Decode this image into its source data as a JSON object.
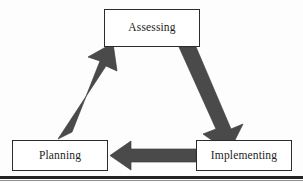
{
  "figure": {
    "type": "cyclical-process-diagram",
    "node_count": 3,
    "arrow_count": 3,
    "colors": {
      "background": "#fdfdfd",
      "box_fill": "#ffffff",
      "box_border": "#2b2b2b",
      "arrow_fill": "#4a4a4a",
      "arrow_edge": "#3a3a3a",
      "text": "#1c1c1c",
      "bottom_rule": "#232323"
    },
    "nodes": [
      {
        "id": "assessing",
        "label": "Assessing"
      },
      {
        "id": "implementing",
        "label": "Implementing"
      },
      {
        "id": "planning",
        "label": "Planning"
      }
    ],
    "arrows": [
      {
        "id": "assessing-to-implementing",
        "from": "Assessing",
        "to": "Implementing",
        "direction": "down-right"
      },
      {
        "id": "implementing-to-planning",
        "from": "Implementing",
        "to": "Planning",
        "direction": "left"
      },
      {
        "id": "planning-to-assessing",
        "from": "Planning",
        "to": "Assessing",
        "direction": "up-right"
      }
    ]
  }
}
